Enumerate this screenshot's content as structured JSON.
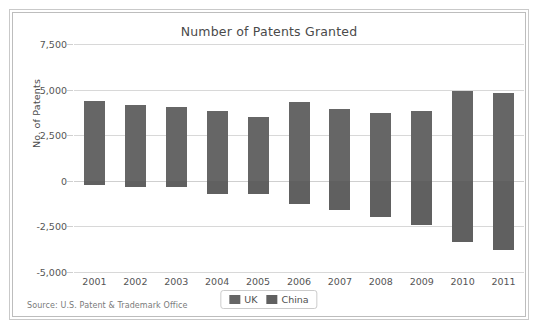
{
  "frame": {
    "border_color": "#bdbdbd",
    "background": "#ffffff"
  },
  "source_note": "Source: U.S. Patent & Trademark Office",
  "legend": {
    "position": "bottom-center",
    "items": [
      {
        "label": "UK",
        "color": "#666666",
        "swatch_name": "legend-swatch-uk"
      },
      {
        "label": "China",
        "color": "#606060",
        "swatch_name": "legend-swatch-china"
      }
    ]
  },
  "chart_data": {
    "type": "bar",
    "title": "Number of Patents Granted",
    "xlabel": "",
    "ylabel": "No. of Patents",
    "categories": [
      "2001",
      "2002",
      "2003",
      "2004",
      "2005",
      "2006",
      "2007",
      "2008",
      "2009",
      "2010",
      "2011"
    ],
    "ylim": [
      -5000,
      7500
    ],
    "yticks": [
      7500,
      5000,
      2500,
      0,
      -2500,
      -5000
    ],
    "ytick_labels": [
      "7,500",
      "5,000",
      "2,500",
      "0",
      "-2,500",
      "-5,000"
    ],
    "grid": true,
    "orientation": "vertical",
    "note": "UK plotted as positive values, China plotted as negative values on a shared zero baseline",
    "series": [
      {
        "name": "UK",
        "color": "#666666",
        "values": [
          4400,
          4150,
          4050,
          3850,
          3500,
          4300,
          3950,
          3700,
          3850,
          4900,
          4800
        ]
      },
      {
        "name": "China",
        "color": "#606060",
        "values": [
          -250,
          -350,
          -350,
          -700,
          -750,
          -1250,
          -1600,
          -2000,
          -2450,
          -3350,
          -3800
        ]
      }
    ]
  }
}
